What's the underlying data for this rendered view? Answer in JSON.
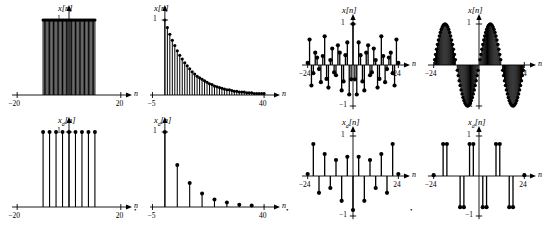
{
  "figure": {
    "type": "multi-panel-stem-plots",
    "panel_count": 8,
    "background": "#ffffff",
    "stem_color": "#000000"
  },
  "chart_data": [
    {
      "id": "panel-1",
      "type": "bar",
      "title": "x[n]",
      "ylabel": "x[n]",
      "xlabel": "n",
      "xlim": [
        -22,
        22
      ],
      "ylim": [
        0,
        1.15
      ],
      "xticks": [
        -20,
        20
      ],
      "xticklabels": [
        "−20",
        "20"
      ],
      "yticks": [
        1
      ],
      "yticklabels": [
        "1"
      ],
      "grid": false,
      "legend": null,
      "description": "rectangular pulse, dense unit samples from -10 to 10",
      "x": [
        -10,
        -9.5,
        -9,
        -8.5,
        -8,
        -7.5,
        -7,
        -6.5,
        -6,
        -5.5,
        -5,
        -4.5,
        -4,
        -3.5,
        -3,
        -2.5,
        -2,
        -1.5,
        -1,
        -0.5,
        0,
        0.5,
        1,
        1.5,
        2,
        2.5,
        3,
        3.5,
        4,
        4.5,
        5,
        5.5,
        6,
        6.5,
        7,
        7.5,
        8,
        8.5,
        9,
        9.5,
        10
      ],
      "values": [
        1,
        1,
        1,
        1,
        1,
        1,
        1,
        1,
        1,
        1,
        1,
        1,
        1,
        1,
        1,
        1,
        1,
        1,
        1,
        1,
        1,
        1,
        1,
        1,
        1,
        1,
        1,
        1,
        1,
        1,
        1,
        1,
        1,
        1,
        1,
        1,
        1,
        1,
        1,
        1,
        1
      ]
    },
    {
      "id": "panel-2",
      "type": "bar",
      "title": "x[n]",
      "ylabel": "x[n]",
      "xlabel": "n",
      "xlim": [
        -6,
        44
      ],
      "ylim": [
        0,
        1.15
      ],
      "xticks": [
        -5,
        40
      ],
      "xticklabels": [
        "−5",
        "40"
      ],
      "yticks": [
        1
      ],
      "yticklabels": [
        "1"
      ],
      "grid": false,
      "legend": null,
      "description": "decaying exponential, dense unit samples starting at n=0 with value 1",
      "x": [
        0,
        1,
        2,
        3,
        4,
        5,
        6,
        7,
        8,
        9,
        10,
        11,
        12,
        13,
        14,
        15,
        16,
        17,
        18,
        19,
        20,
        21,
        22,
        23,
        24,
        25,
        26,
        27,
        28,
        29,
        30,
        31,
        32,
        33,
        34,
        35,
        36,
        37,
        38,
        39,
        40
      ],
      "values": [
        1.0,
        0.9,
        0.81,
        0.73,
        0.66,
        0.59,
        0.53,
        0.48,
        0.43,
        0.39,
        0.35,
        0.31,
        0.28,
        0.25,
        0.23,
        0.21,
        0.19,
        0.17,
        0.15,
        0.14,
        0.12,
        0.11,
        0.1,
        0.09,
        0.08,
        0.07,
        0.07,
        0.06,
        0.05,
        0.05,
        0.04,
        0.04,
        0.04,
        0.03,
        0.03,
        0.03,
        0.02,
        0.02,
        0.02,
        0.02,
        0.02
      ]
    },
    {
      "id": "panel-3",
      "type": "bar",
      "title": "x[n]",
      "ylabel": "x[n]",
      "xlabel": "n",
      "xlim": [
        -27,
        27
      ],
      "ylim": [
        -1.15,
        1.15
      ],
      "xticks": [
        -24,
        24
      ],
      "xticklabels": [
        "−24",
        "24"
      ],
      "yticks": [
        1,
        -1
      ],
      "yticklabels": [
        "1",
        "−1"
      ],
      "grid": false,
      "legend": null,
      "description": "aliased sampled sinusoid, sparse bipolar stems with beating envelope",
      "x": [
        -24,
        -23,
        -22,
        -21,
        -20,
        -19,
        -18,
        -17,
        -16,
        -15,
        -14,
        -13,
        -12,
        -11,
        -10,
        -9,
        -8,
        -7,
        -6,
        -5,
        -4,
        -3,
        -2,
        -1,
        0,
        1,
        2,
        3,
        4,
        5,
        6,
        7,
        8,
        9,
        10,
        11,
        12,
        13,
        14,
        15,
        16,
        17,
        18,
        19,
        20,
        21,
        22,
        23,
        24
      ],
      "values": [
        0.05,
        0.62,
        -0.5,
        -0.2,
        0.3,
        0.18,
        -0.1,
        -0.42,
        0.22,
        0.7,
        -0.34,
        -0.55,
        0.12,
        0.4,
        -0.18,
        -0.25,
        0.48,
        0.3,
        -0.62,
        -0.4,
        0.24,
        0.55,
        -0.72,
        -0.35,
        1.0,
        -0.35,
        -0.72,
        0.55,
        0.24,
        -0.4,
        -0.62,
        0.3,
        0.48,
        -0.25,
        -0.18,
        0.4,
        0.12,
        -0.55,
        -0.34,
        0.7,
        0.22,
        -0.42,
        -0.1,
        0.18,
        0.3,
        -0.2,
        -0.5,
        0.62,
        0.05
      ]
    },
    {
      "id": "panel-4",
      "type": "bar",
      "title": "x[n]",
      "ylabel": "x[n]",
      "xlabel": "n",
      "xlim": [
        -27,
        27
      ],
      "ylim": [
        -1.15,
        1.15
      ],
      "xticks": [
        -24,
        24
      ],
      "xticklabels": [
        "−24",
        "24"
      ],
      "yticks": [
        1,
        -1
      ],
      "yticklabels": [
        "1",
        "−1"
      ],
      "grid": false,
      "legend": null,
      "description": "densely sampled sinusoid, two full cycles, amplitude 1",
      "samples": 97,
      "cycles": 2.0,
      "amplitude": 1.0
    },
    {
      "id": "panel-5",
      "type": "bar",
      "title": "x_d[n]",
      "ylabel": "x_d[n]",
      "xlabel": "n",
      "xlim": [
        -22,
        22
      ],
      "ylim": [
        0,
        1.15
      ],
      "xticks": [
        -20,
        20
      ],
      "xticklabels": [
        "−20",
        "20"
      ],
      "yticks": [
        1
      ],
      "yticklabels": [
        "1"
      ],
      "grid": false,
      "legend": null,
      "description": "decimated rectangular pulse, 9 unit samples spaced every 2.5 units",
      "x": [
        -10,
        -7.5,
        -5,
        -2.5,
        0,
        2.5,
        5,
        7.5,
        10
      ],
      "values": [
        1,
        1,
        1,
        1,
        1,
        1,
        1,
        1,
        1
      ]
    },
    {
      "id": "panel-6",
      "type": "bar",
      "title": "x_d[n]",
      "ylabel": "x_d[n]",
      "xlabel": "n",
      "xlim": [
        -6,
        44
      ],
      "ylim": [
        0,
        1.15
      ],
      "xticks": [
        -5,
        40
      ],
      "xticklabels": [
        "−5",
        "40"
      ],
      "yticks": [
        1
      ],
      "yticklabels": [
        "1"
      ],
      "grid": false,
      "legend": null,
      "description": "decimated decaying exponential, samples every 5 units",
      "x": [
        0,
        5,
        10,
        15,
        20,
        25,
        30,
        35,
        40
      ],
      "values": [
        1.0,
        0.56,
        0.32,
        0.18,
        0.1,
        0.06,
        0.03,
        0.02,
        0.01
      ]
    },
    {
      "id": "panel-7",
      "type": "bar",
      "title": "x_d[n]",
      "ylabel": "x_d[n]",
      "xlabel": "n",
      "xlim": [
        -27,
        27
      ],
      "ylim": [
        -1.15,
        1.15
      ],
      "xticks": [
        -24,
        24
      ],
      "xticklabels": [
        "−24",
        "24"
      ],
      "yticks": [
        1,
        -1
      ],
      "yticklabels": [
        "1",
        "−1"
      ],
      "grid": false,
      "legend": null,
      "description": "decimated aliased sinusoid, sparse bipolar stems",
      "x": [
        -24,
        -21,
        -18,
        -15,
        -12,
        -9,
        -6,
        -3,
        0,
        3,
        6,
        9,
        12,
        15,
        18,
        21,
        24
      ],
      "values": [
        0.05,
        0.8,
        -0.42,
        0.55,
        -0.3,
        0.4,
        -0.62,
        0.48,
        -0.85,
        0.48,
        -0.62,
        0.4,
        -0.3,
        0.55,
        -0.42,
        0.8,
        0.05
      ]
    },
    {
      "id": "panel-8",
      "type": "bar",
      "title": "x_d[n]",
      "ylabel": "x_d[n]",
      "xlabel": "n",
      "xlim": [
        -27,
        27
      ],
      "ylim": [
        -1.15,
        1.15
      ],
      "xticks": [
        -24,
        24
      ],
      "xticklabels": [
        "−24",
        "24"
      ],
      "yticks": [
        1,
        -1
      ],
      "yticklabels": [
        "1",
        "−1"
      ],
      "grid": false,
      "legend": null,
      "description": "decimated sinusoid, paired positive and negative stems",
      "x": [
        -24,
        -19,
        -17,
        -10,
        -8,
        -5,
        -3,
        2,
        4,
        9,
        11,
        16,
        18,
        24
      ],
      "values": [
        0.02,
        0.8,
        0.8,
        -0.78,
        -0.78,
        0.8,
        0.8,
        -0.78,
        -0.78,
        0.8,
        0.8,
        -0.78,
        -0.78,
        0.02
      ]
    }
  ],
  "separators": {
    "marks": [
      "•",
      "•",
      "•"
    ]
  }
}
